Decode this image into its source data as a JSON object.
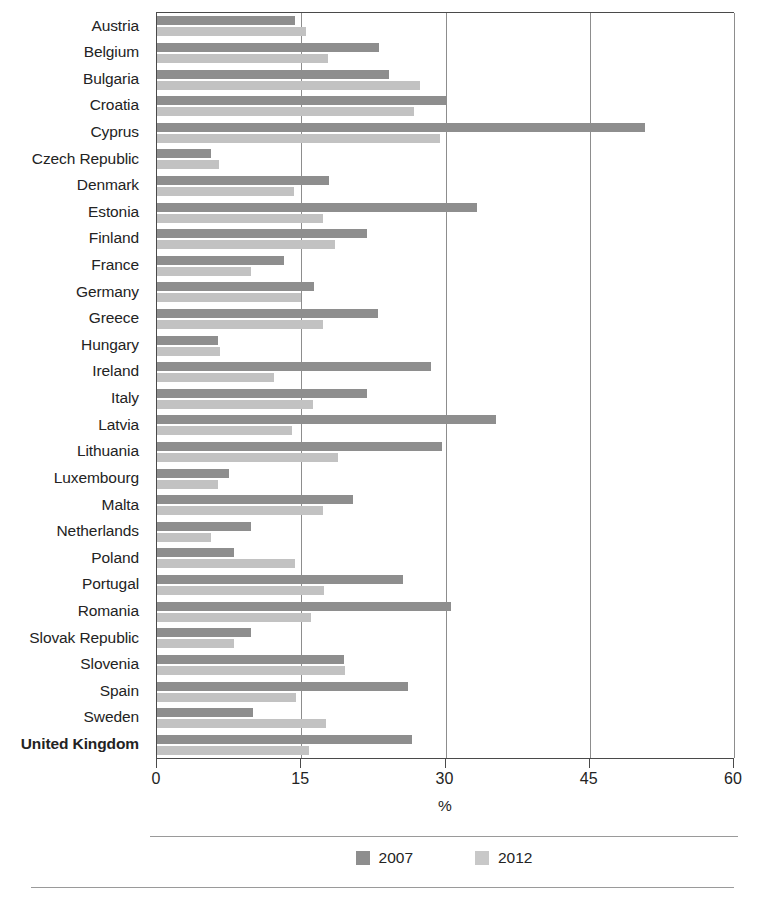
{
  "chart_data": {
    "type": "bar",
    "orientation": "horizontal",
    "title": "",
    "xlabel": "%",
    "ylabel": "",
    "xlim": [
      0,
      60
    ],
    "xticks": [
      0,
      15,
      30,
      45,
      60
    ],
    "xtick_labels": [
      "0",
      "15",
      "30",
      "45",
      "60"
    ],
    "grid": "vertical",
    "legend_position": "bottom-center",
    "legend": [
      "2007",
      "2012"
    ],
    "categories": [
      "Austria",
      "Belgium",
      "Bulgaria",
      "Croatia",
      "Cyprus",
      "Czech Republic",
      "Denmark",
      "Estonia",
      "Finland",
      "France",
      "Germany",
      "Greece",
      "Hungary",
      "Ireland",
      "Italy",
      "Latvia",
      "Lithuania",
      "Luxembourg",
      "Malta",
      "Netherlands",
      "Poland",
      "Portugal",
      "Romania",
      "Slovak Republic",
      "Slovenia",
      "Spain",
      "Sweden",
      "United Kingdom"
    ],
    "emphasized_categories": [
      "United Kingdom"
    ],
    "series": [
      {
        "name": "2007",
        "color": "#8e8e8e",
        "values": [
          14.3,
          23.1,
          24.1,
          30.0,
          50.7,
          5.6,
          17.9,
          33.3,
          21.8,
          13.2,
          16.3,
          23.0,
          6.3,
          28.5,
          21.8,
          35.3,
          29.6,
          7.5,
          20.4,
          9.8,
          8.0,
          25.6,
          30.6,
          9.8,
          19.4,
          26.1,
          10.0,
          26.5
        ]
      },
      {
        "name": "2012",
        "color": "#c2c2c2",
        "values": [
          15.5,
          17.8,
          27.3,
          26.7,
          29.4,
          6.4,
          14.2,
          17.3,
          18.5,
          9.8,
          15.0,
          17.3,
          6.5,
          12.2,
          16.2,
          14.0,
          18.8,
          6.3,
          17.3,
          5.6,
          14.3,
          17.4,
          16.0,
          8.0,
          19.5,
          14.5,
          17.6,
          15.8
        ]
      }
    ]
  }
}
